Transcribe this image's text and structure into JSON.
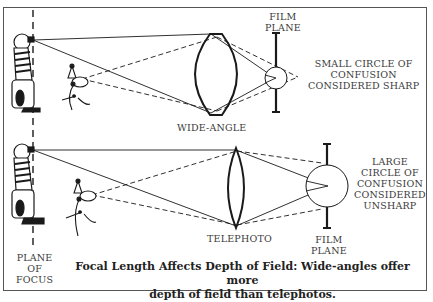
{
  "figure": {
    "title": "Focal Length Affects Depth of Field",
    "caption_line1": "Focal Length Affects Depth of Field:  Wide-angles offer more",
    "caption_line2": "depth of field than telephotos."
  },
  "top_panel": {
    "lens_label": "WIDE-ANGLE",
    "film_plane_label_line1": "FILM",
    "film_plane_label_line2": "PLANE",
    "note_line1": "SMALL CIRCLE OF",
    "note_line2": "CONFUSION",
    "note_line3": "CONSIDERED SHARP"
  },
  "bottom_panel": {
    "lens_label": "TELEPHOTO",
    "film_plane_label_line1": "FILM",
    "film_plane_label_line2": "PLANE",
    "note_line1": "LARGE",
    "note_line2": "CIRCLE OF",
    "note_line3": "CONFUSION",
    "note_line4": "CONSIDERED",
    "note_line5": "UNSHARP"
  },
  "plane_of_focus": {
    "line1": "PLANE",
    "line2": "OF",
    "line3": "FOCUS"
  },
  "illustrations": {
    "subject_near": "clown-figure",
    "subject_far": "dog-figure"
  }
}
